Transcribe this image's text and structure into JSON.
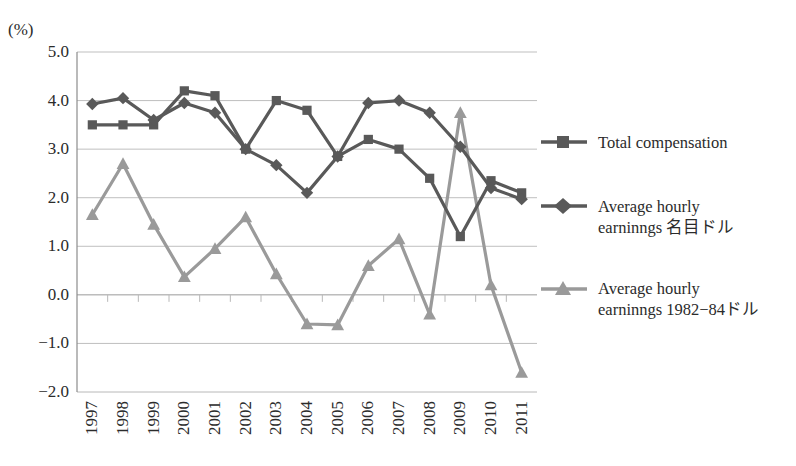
{
  "title_fragment": " ",
  "axis": {
    "unit_label": "(%)",
    "y_ticks": [
      "5.0",
      "4.0",
      "3.0",
      "2.0",
      "1.0",
      "0.0",
      "−1.0",
      "−2.0"
    ],
    "y_min": -2.0,
    "y_max": 5.0,
    "y_step": 1.0
  },
  "legend": {
    "items": [
      {
        "label": "Total compensation",
        "marker": "square",
        "color": "#595959"
      },
      {
        "label": "Average hourly\nearninngs 名目ドル",
        "marker": "diamond",
        "color": "#595959"
      },
      {
        "label": "Average hourly\nearninngs 1982−84ドル",
        "marker": "triangle",
        "color": "#9a9a9a"
      }
    ]
  },
  "colors": {
    "series_dark": "#595959",
    "series_light": "#9a9a9a",
    "gridline": "#b8b8b8",
    "axis": "#8c8c8c",
    "text": "#2b2b2b",
    "background": "#ffffff"
  },
  "chart_data": {
    "type": "line",
    "title": "",
    "xlabel": "",
    "ylabel": "(%)",
    "ylim": [
      -2.0,
      5.0
    ],
    "grid": true,
    "legend_position": "right",
    "categories": [
      "1997",
      "1998",
      "1999",
      "2000",
      "2001",
      "2002",
      "2003",
      "2004",
      "2005",
      "2006",
      "2007",
      "2008",
      "2009",
      "2010",
      "2011"
    ],
    "series": [
      {
        "name": "Total compensation",
        "marker": "square",
        "color": "#595959",
        "values": [
          3.5,
          3.5,
          3.5,
          4.2,
          4.1,
          3.0,
          4.0,
          3.8,
          2.85,
          3.2,
          3.0,
          2.4,
          1.2,
          2.35,
          2.1
        ]
      },
      {
        "name": "Average hourly earninngs 名目ドル",
        "marker": "diamond",
        "color": "#595959",
        "values": [
          3.93,
          4.05,
          3.6,
          3.95,
          3.75,
          3.0,
          2.67,
          2.1,
          2.85,
          3.95,
          4.0,
          3.75,
          3.05,
          2.2,
          1.97
        ]
      },
      {
        "name": "Average hourly earninngs 1982−84ドル",
        "marker": "triangle",
        "color": "#9a9a9a",
        "values": [
          1.65,
          2.7,
          1.45,
          0.37,
          0.95,
          1.6,
          0.43,
          -0.6,
          -0.62,
          0.6,
          1.15,
          -0.4,
          3.75,
          0.2,
          -1.6
        ]
      }
    ]
  }
}
